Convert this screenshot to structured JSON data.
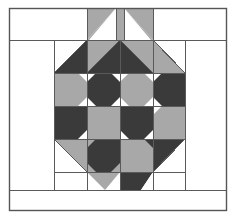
{
  "artwork": {
    "title": "Pieced Quilt Block Diagram",
    "type": "quilt-block-line-drawing",
    "canvas": {
      "width": 236,
      "height": 219
    },
    "palette": {
      "background": "#ffffff",
      "white_patch": "#ffffff",
      "light_gray_patch": "#a8a8a8",
      "dark_gray_patch": "#3a3a3a",
      "seam_line": "#5a5a5a",
      "outer_frame_line": "#555555"
    },
    "geometry": {
      "outer_frame": {
        "x": 9,
        "y": 8,
        "w": 218,
        "h": 203
      },
      "inner_border_top_y": 40,
      "inner_border_bottom_y": 190,
      "body_left_x": 54,
      "body_right_x": 185,
      "body_top_y": 40,
      "body_bottom_y": 172,
      "grid_columns": [
        54,
        87,
        120,
        153,
        185
      ],
      "grid_rows": [
        40,
        73,
        106,
        139,
        172
      ],
      "crown_top_y": 8,
      "crown_band_left_x": 87,
      "crown_band_right_x": 153,
      "crown_center_strip": [
        116,
        124
      ],
      "stem_row": {
        "top_y": 172,
        "bottom_y": 190
      }
    },
    "patch_counts": {
      "light_gray": 24,
      "dark_gray": 20,
      "white": 18
    }
  },
  "legend": {
    "light_label": "light gray fabric",
    "dark_label": "dark gray fabric",
    "ground_label": "background white"
  }
}
